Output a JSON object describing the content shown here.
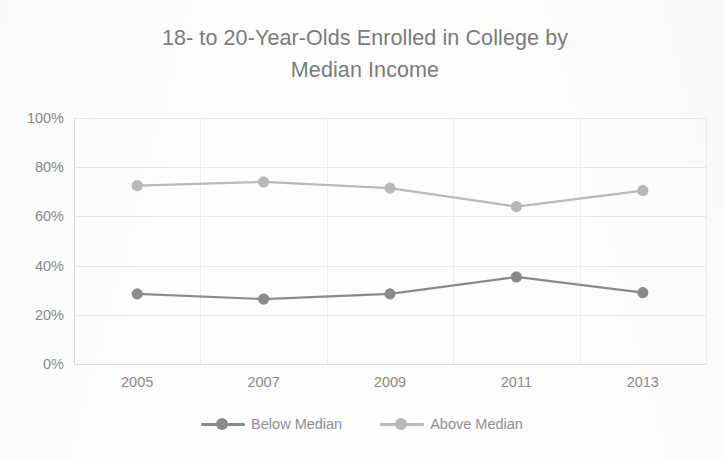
{
  "chart_data": {
    "type": "line",
    "title_line1": "18- to 20-Year-Olds Enrolled in College by",
    "title_line2": "Median Income",
    "xlabel": "",
    "ylabel": "",
    "categories": [
      "2005",
      "2007",
      "2009",
      "2011",
      "2013"
    ],
    "series": [
      {
        "name": "Below Median",
        "color": "#8a8a8a",
        "values": [
          28.5,
          26.4,
          28.5,
          35.4,
          29.0
        ]
      },
      {
        "name": "Above Median",
        "color": "#b9b9b9",
        "values": [
          72.5,
          74.0,
          71.5,
          64.0,
          70.5
        ]
      }
    ],
    "ylim": [
      0,
      100
    ],
    "ytick_values": [
      0,
      20,
      40,
      60,
      80,
      100
    ],
    "ytick_labels": [
      "0%",
      "20%",
      "40%",
      "60%",
      "80%",
      "100%"
    ],
    "grid": true,
    "grid_axis": "both",
    "legend_position": "bottom",
    "value_suffix": "%"
  },
  "style": {
    "background": "#fdfdfd",
    "title_color": "#7b7b7b",
    "tick_color": "#8a8a8a",
    "gridline_color": "#e9e9e9",
    "axis_color": "#d8d8d8"
  }
}
